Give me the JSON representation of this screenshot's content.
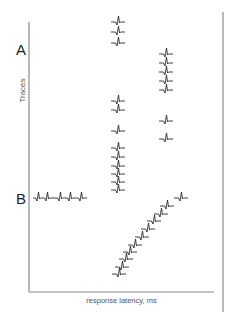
{
  "figure": {
    "panel_labels": {
      "a": "A",
      "b": "B"
    },
    "ylabel": "Traces",
    "xlabel": "response latency, ms",
    "colors": {
      "axis": "#8a8a8a",
      "trace": "#2a2a2a",
      "frame_right": "#8a8a8a"
    },
    "axes": {
      "y_axis": {
        "x": 29,
        "y1": 22,
        "y2": 292
      },
      "x_axis": {
        "y": 292,
        "x1": 29,
        "x2": 214
      },
      "right_rule": {
        "x": 223,
        "y1": 12,
        "y2": 312
      }
    }
  },
  "chart_data": {
    "type": "scatter",
    "title": "",
    "xlabel": "response latency, ms",
    "ylabel": "Traces",
    "grid": false,
    "panels": [
      {
        "name": "A",
        "description": "fixed-latency responses stacked in two columns",
        "traces": [
          {
            "x": 118,
            "y": 22
          },
          {
            "x": 118,
            "y": 32
          },
          {
            "x": 118,
            "y": 43
          },
          {
            "x": 166,
            "y": 54
          },
          {
            "x": 166,
            "y": 63
          },
          {
            "x": 166,
            "y": 72
          },
          {
            "x": 166,
            "y": 81
          },
          {
            "x": 166,
            "y": 90
          },
          {
            "x": 118,
            "y": 101
          },
          {
            "x": 118,
            "y": 110
          },
          {
            "x": 166,
            "y": 121
          },
          {
            "x": 118,
            "y": 131
          },
          {
            "x": 166,
            "y": 139
          },
          {
            "x": 118,
            "y": 148
          },
          {
            "x": 118,
            "y": 157
          },
          {
            "x": 118,
            "y": 166
          },
          {
            "x": 118,
            "y": 174
          },
          {
            "x": 118,
            "y": 182
          },
          {
            "x": 118,
            "y": 190
          }
        ]
      },
      {
        "name": "B",
        "description": "stimulus train (horizontal) and progressively shifting latency (diagonal)",
        "stimulus_train": {
          "x1": 33,
          "x2": 87,
          "y": 198,
          "spike_x": [
            38,
            47,
            60,
            70,
            81
          ]
        },
        "traces": [
          {
            "x": 181,
            "y": 198
          },
          {
            "x": 167,
            "y": 206
          },
          {
            "x": 161,
            "y": 214
          },
          {
            "x": 154,
            "y": 221
          },
          {
            "x": 148,
            "y": 229
          },
          {
            "x": 142,
            "y": 237
          },
          {
            "x": 135,
            "y": 245
          },
          {
            "x": 130,
            "y": 252
          },
          {
            "x": 126,
            "y": 259
          },
          {
            "x": 122,
            "y": 267
          },
          {
            "x": 119,
            "y": 274
          }
        ]
      }
    ]
  }
}
